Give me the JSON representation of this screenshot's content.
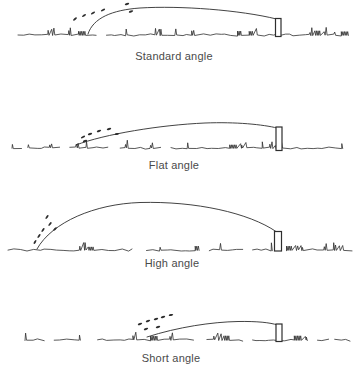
{
  "figure": {
    "background": "#ffffff",
    "ink_color": "#2e2e2e",
    "label_color": "#4a4a4a",
    "width": 356,
    "height": 373,
    "panels": [
      {
        "id": "standard-angle",
        "label": "Standard angle",
        "label_x": 174,
        "label_y": 50,
        "ground": {
          "y": 35,
          "x_start": 18,
          "x_end": 350,
          "seed": 11,
          "gap_prob": 0.05,
          "tuft_prob": 0.2,
          "cluster_prob": 0.03
        },
        "trajectory_path": "M 88 34 C 93 18 112 10 140 8 C 180 5.5 240 10 276.5 19",
        "pole": {
          "x": 275.5,
          "y": 18.5,
          "width": 5.5,
          "height": 18
        },
        "divots": [
          [
            75,
            19,
            -40
          ],
          [
            84,
            15.5,
            -35
          ],
          [
            93,
            13,
            -30
          ],
          [
            103,
            10,
            -25
          ],
          [
            127,
            4,
            -15
          ],
          [
            131,
            11.5,
            -18
          ]
        ]
      },
      {
        "id": "flat-angle",
        "label": "Flat angle",
        "label_x": 174,
        "label_y": 159,
        "ground": {
          "y": 148,
          "x_start": 12,
          "x_end": 345,
          "seed": 22,
          "gap_prob": 0.04,
          "tuft_prob": 0.22,
          "cluster_prob": 0.035
        },
        "trajectory_path": "M 76 145 C 105 134 160 125 205 123 C 236 121.8 263 124.5 277 128",
        "pole": {
          "x": 276,
          "y": 127,
          "width": 6,
          "height": 23.5
        },
        "divots": [
          [
            83,
            137,
            -25
          ],
          [
            90,
            134,
            -22
          ],
          [
            99,
            131,
            -18
          ],
          [
            109,
            129,
            -15
          ],
          [
            117,
            134,
            -12
          ],
          [
            85,
            141,
            -22
          ]
        ]
      },
      {
        "id": "high-angle",
        "label": "High angle",
        "label_x": 172,
        "label_y": 257,
        "ground": {
          "y": 250,
          "x_start": 8,
          "x_end": 350,
          "seed": 33,
          "gap_prob": 0.06,
          "tuft_prob": 0.16,
          "cluster_prob": 0.03
        },
        "trajectory_path": "M 37 249 C 52 222 95 204 140 202.5 C 196 201 249 213 276 231.5",
        "pole": {
          "x": 274.5,
          "y": 231.5,
          "width": 7,
          "height": 19.5
        },
        "divots": [
          [
            35,
            242,
            -60
          ],
          [
            39,
            236,
            -55
          ],
          [
            43,
            230,
            -55
          ],
          [
            50,
            224,
            -50
          ],
          [
            55,
            229,
            -45
          ],
          [
            47,
            217,
            -55
          ]
        ]
      },
      {
        "id": "short-angle",
        "label": "Short angle",
        "label_x": 171,
        "label_y": 352,
        "ground": {
          "y": 340,
          "x_start": 25,
          "x_end": 347,
          "seed": 44,
          "gap_prob": 0.1,
          "tuft_prob": 0.18,
          "cluster_prob": 0.04
        },
        "trajectory_path": "M 147 337 C 178 327 212 322 238 321.5 C 257 321.2 270 322.5 277.5 325",
        "pole": {
          "x": 276,
          "y": 324,
          "width": 6,
          "height": 17.5
        },
        "divots": [
          [
            140,
            324,
            -18
          ],
          [
            148,
            321,
            -18
          ],
          [
            156,
            319,
            -15
          ],
          [
            163,
            317,
            -15
          ],
          [
            171,
            315,
            -12
          ],
          [
            146,
            329,
            -18
          ],
          [
            158,
            327,
            -15
          ]
        ]
      }
    ]
  }
}
